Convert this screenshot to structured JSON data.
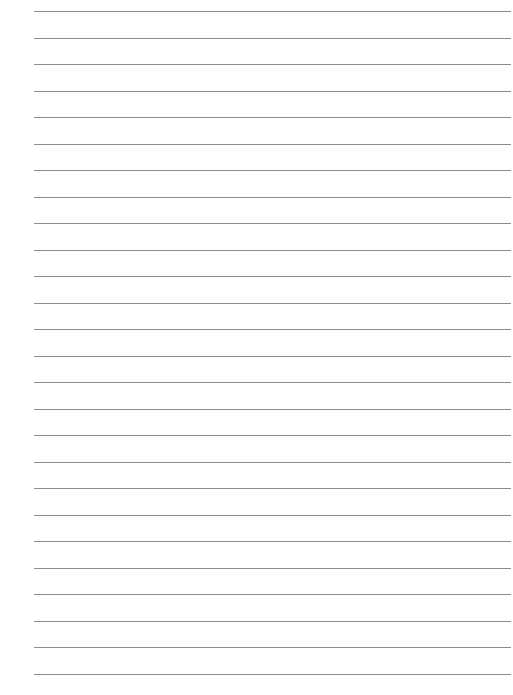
{
  "page": {
    "type": "blank ruled sheet",
    "line_count": 26,
    "first_line_y": 11,
    "line_spacing": 26.5,
    "line_left": 34,
    "line_right": 511,
    "line_color": "#8c8c8c",
    "background": "#ffffff"
  }
}
